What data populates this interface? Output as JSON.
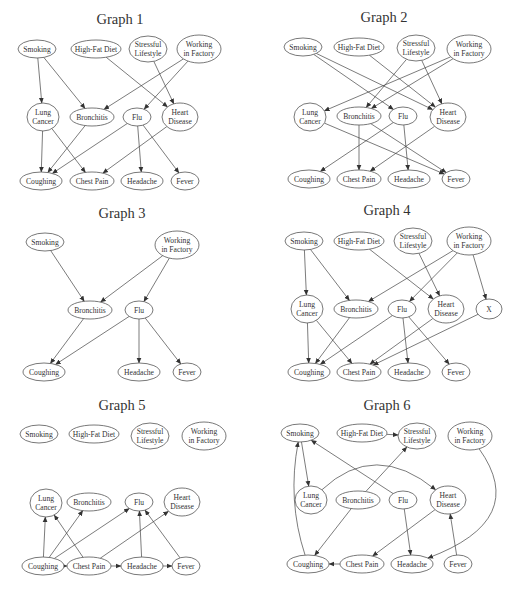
{
  "figure": {
    "node_labels": {
      "smoking": [
        "Smoking"
      ],
      "highfat": [
        "High-Fat Diet"
      ],
      "stress": [
        "Stressful",
        "Lifestyle"
      ],
      "factory": [
        "Working",
        "in Factory"
      ],
      "lung": [
        "Lung",
        "Cancer"
      ],
      "bron": [
        "Bronchitis"
      ],
      "flu": [
        "Flu"
      ],
      "heart": [
        "Heart",
        "Disease"
      ],
      "cough": [
        "Coughing"
      ],
      "chest": [
        "Chest Pain"
      ],
      "head": [
        "Headache"
      ],
      "fever": [
        "Fever"
      ],
      "x": [
        "X"
      ]
    },
    "node_sizes": {
      "smoking": [
        19,
        9
      ],
      "highfat": [
        25,
        9
      ],
      "stress": [
        19,
        13
      ],
      "factory": [
        22,
        14
      ],
      "lung": [
        16,
        14
      ],
      "bron": [
        22,
        9
      ],
      "flu": [
        14,
        9
      ],
      "heart": [
        18,
        14
      ],
      "cough": [
        21,
        9
      ],
      "chest": [
        22,
        9
      ],
      "head": [
        21,
        9
      ],
      "fever": [
        14,
        9
      ],
      "x": [
        13,
        10
      ]
    },
    "graphs": [
      {
        "title": "Graph 1",
        "title_pos": [
          120,
          24
        ],
        "nodes": {
          "smoking": [
            37,
            49
          ],
          "highfat": [
            96,
            49
          ],
          "stress": [
            148,
            49
          ],
          "factory": [
            199,
            49
          ],
          "lung": [
            43,
            117
          ],
          "bron": [
            92,
            117
          ],
          "flu": [
            137,
            117
          ],
          "heart": [
            180,
            117
          ],
          "cough": [
            41,
            181
          ],
          "chest": [
            92,
            181
          ],
          "head": [
            142,
            181
          ],
          "fever": [
            185,
            181
          ]
        },
        "edges": [
          [
            "smoking",
            "lung"
          ],
          [
            "smoking",
            "bron"
          ],
          [
            "highfat",
            "heart"
          ],
          [
            "stress",
            "heart"
          ],
          [
            "factory",
            "bron"
          ],
          [
            "factory",
            "flu"
          ],
          [
            "lung",
            "cough"
          ],
          [
            "lung",
            "chest"
          ],
          [
            "bron",
            "cough"
          ],
          [
            "flu",
            "cough"
          ],
          [
            "flu",
            "head"
          ],
          [
            "flu",
            "fever"
          ],
          [
            "heart",
            "chest"
          ]
        ]
      },
      {
        "title": "Graph 2",
        "title_pos": [
          384,
          22
        ],
        "nodes": {
          "smoking": [
            303,
            47
          ],
          "highfat": [
            359,
            47
          ],
          "stress": [
            416,
            48
          ],
          "factory": [
            469,
            49
          ],
          "lung": [
            310,
            117
          ],
          "bron": [
            359,
            116
          ],
          "flu": [
            403,
            116
          ],
          "heart": [
            448,
            117
          ],
          "cough": [
            309,
            179
          ],
          "chest": [
            359,
            179
          ],
          "head": [
            409,
            179
          ],
          "fever": [
            456,
            179
          ]
        },
        "edges": [
          [
            "smoking",
            "flu"
          ],
          [
            "smoking",
            "heart"
          ],
          [
            "highfat",
            "heart"
          ],
          [
            "stress",
            "bron"
          ],
          [
            "stress",
            "heart"
          ],
          [
            "factory",
            "lung"
          ],
          [
            "factory",
            "bron"
          ],
          [
            "lung",
            "fever"
          ],
          [
            "bron",
            "chest"
          ],
          [
            "bron",
            "fever"
          ],
          [
            "flu",
            "cough"
          ],
          [
            "flu",
            "head"
          ],
          [
            "heart",
            "chest"
          ]
        ]
      },
      {
        "title": "Graph 3",
        "title_pos": [
          122,
          218
        ],
        "nodes": {
          "smoking": [
            45,
            242
          ],
          "factory": [
            177,
            245
          ],
          "bron": [
            90,
            310
          ],
          "flu": [
            139,
            310
          ],
          "cough": [
            44,
            372
          ],
          "head": [
            139,
            372
          ],
          "fever": [
            187,
            372
          ]
        },
        "edges": [
          [
            "smoking",
            "bron"
          ],
          [
            "factory",
            "bron"
          ],
          [
            "factory",
            "flu"
          ],
          [
            "bron",
            "cough"
          ],
          [
            "flu",
            "cough"
          ],
          [
            "flu",
            "head"
          ],
          [
            "flu",
            "fever"
          ]
        ]
      },
      {
        "title": "Graph 4",
        "title_pos": [
          387,
          215
        ],
        "nodes": {
          "smoking": [
            304,
            241
          ],
          "highfat": [
            359,
            241
          ],
          "stress": [
            413,
            241
          ],
          "factory": [
            469,
            241
          ],
          "lung": [
            307,
            309
          ],
          "bron": [
            356,
            309
          ],
          "flu": [
            402,
            309
          ],
          "heart": [
            446,
            309
          ],
          "x": [
            489,
            309
          ],
          "cough": [
            309,
            372
          ],
          "chest": [
            359,
            372
          ],
          "head": [
            409,
            372
          ],
          "fever": [
            456,
            372
          ]
        },
        "edges": [
          [
            "smoking",
            "lung"
          ],
          [
            "smoking",
            "bron"
          ],
          [
            "highfat",
            "heart"
          ],
          [
            "stress",
            "heart"
          ],
          [
            "factory",
            "bron"
          ],
          [
            "factory",
            "flu"
          ],
          [
            "factory",
            "x"
          ],
          [
            "lung",
            "cough"
          ],
          [
            "lung",
            "chest"
          ],
          [
            "bron",
            "cough"
          ],
          [
            "flu",
            "cough"
          ],
          [
            "flu",
            "head"
          ],
          [
            "flu",
            "fever"
          ],
          [
            "heart",
            "chest"
          ],
          [
            "x",
            "chest"
          ]
        ]
      },
      {
        "title": "Graph 5",
        "title_pos": [
          122,
          410
        ],
        "nodes": {
          "smoking": [
            39,
            434
          ],
          "highfat": [
            94,
            434
          ],
          "stress": [
            150,
            436
          ],
          "factory": [
            204,
            436
          ],
          "lung": [
            46,
            503
          ],
          "bron": [
            89,
            502
          ],
          "flu": [
            139,
            502
          ],
          "heart": [
            182,
            502
          ],
          "cough": [
            43,
            566
          ],
          "chest": [
            89,
            566
          ],
          "head": [
            142,
            566
          ],
          "fever": [
            186,
            566
          ]
        },
        "edges": [
          [
            "cough",
            "lung"
          ],
          [
            "cough",
            "bron"
          ],
          [
            "cough",
            "flu"
          ],
          [
            "cough",
            "chest"
          ],
          [
            "chest",
            "lung"
          ],
          [
            "chest",
            "heart"
          ],
          [
            "chest",
            "head"
          ],
          [
            "head",
            "flu"
          ],
          [
            "head",
            "fever"
          ],
          [
            "fever",
            "flu"
          ]
        ]
      },
      {
        "title": "Graph 6",
        "title_pos": [
          387,
          410
        ],
        "nodes": {
          "smoking": [
            300,
            433
          ],
          "highfat": [
            362,
            433
          ],
          "stress": [
            417,
            436
          ],
          "factory": [
            470,
            436
          ],
          "lung": [
            311,
            500
          ],
          "bron": [
            358,
            500
          ],
          "flu": [
            403,
            500
          ],
          "heart": [
            448,
            500
          ],
          "cough": [
            308,
            564
          ],
          "chest": [
            362,
            564
          ],
          "head": [
            412,
            564
          ],
          "fever": [
            458,
            564
          ]
        },
        "edges": [
          [
            "smoking",
            "lung"
          ],
          [
            "highfat",
            "stress"
          ],
          [
            "bron",
            "stress"
          ],
          [
            "bron",
            "cough"
          ],
          [
            "flu",
            "smoking"
          ],
          [
            "flu",
            "head"
          ],
          [
            "heart",
            "chest"
          ],
          [
            "chest",
            "cough"
          ],
          [
            "fever",
            "heart"
          ],
          [
            "cough",
            "smoking",
            "curve",
            [
              287,
              500
            ]
          ],
          [
            "lung",
            "heart",
            "curve",
            [
              375,
              440
            ]
          ],
          [
            "factory",
            "head",
            "curve",
            [
              530,
              520
            ]
          ]
        ]
      }
    ]
  }
}
